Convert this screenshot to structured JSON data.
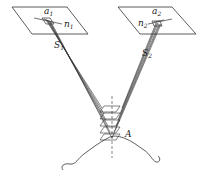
{
  "diagram": {
    "labels": {
      "a1": "a",
      "a1_sub": "1",
      "n1": "n",
      "n1_sub": "1",
      "S1": "S",
      "S1_sub": "1",
      "a2": "a",
      "a2_sub": "2",
      "n2": "n",
      "n2_sub": "2",
      "S2": "S",
      "S2_sub": "2",
      "A": "A"
    },
    "colors": {
      "stroke": "#333333",
      "background": "#ffffff"
    }
  }
}
